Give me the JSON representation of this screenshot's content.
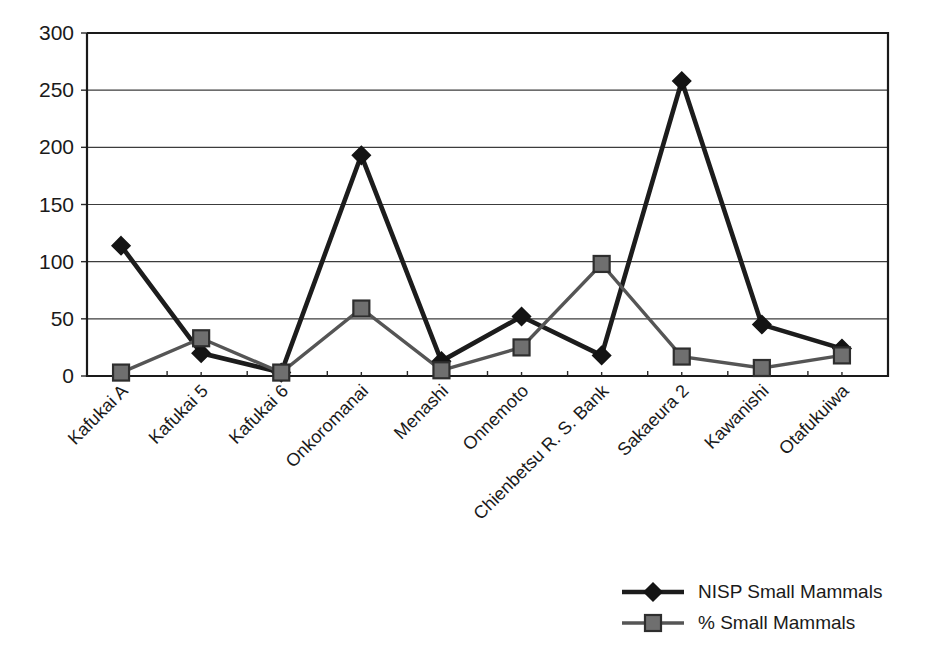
{
  "chart_data": {
    "type": "line",
    "title": "",
    "xlabel": "",
    "ylabel": "",
    "ylim": [
      0,
      300
    ],
    "yticks": [
      0,
      50,
      100,
      150,
      200,
      250,
      300
    ],
    "grid": true,
    "legend_position": "bottom-right",
    "categories": [
      "Kafukai A",
      "Kafukai 5",
      "Kafukai 6",
      "Onkoromanai",
      "Menashi",
      "Onnemoto",
      "Chienbetsu R. S. Bank",
      "Sakaeura 2",
      "Kawanishi",
      "Otafukuiwa"
    ],
    "series": [
      {
        "name": "NISP Small Mammals",
        "marker": "diamond",
        "color": "#141414",
        "values": [
          114,
          20,
          3,
          193,
          13,
          52,
          18,
          258,
          45,
          24
        ]
      },
      {
        "name": "% Small Mammals",
        "marker": "square",
        "color": "#6f6f6f",
        "values": [
          3,
          33,
          3,
          59,
          5,
          25,
          98,
          17,
          7,
          18
        ]
      }
    ]
  },
  "legend": {
    "items": [
      {
        "label": "NISP Small Mammals",
        "marker": "diamond-marker-icon"
      },
      {
        "label": "% Small Mammals",
        "marker": "square-marker-icon"
      }
    ]
  },
  "caption": {
    "text": ""
  }
}
